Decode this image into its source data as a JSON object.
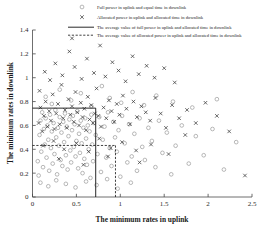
{
  "chart_data": {
    "type": "scatter",
    "title": "",
    "xlabel": "The minimum rates in uplink",
    "ylabel": "The minimum rates in downlink",
    "xlim": [
      0,
      2.5
    ],
    "ylim": [
      0,
      1.4
    ],
    "xticks": [
      "0",
      "0.5",
      "1",
      "1.5",
      "2",
      "2.5"
    ],
    "xtick_values": [
      0,
      0.5,
      1,
      1.5,
      2,
      2.5
    ],
    "yticks": [
      "0",
      "0.2",
      "0.4",
      "0.6",
      "0.8",
      "1",
      "1.2",
      "1.4"
    ],
    "ytick_values": [
      0,
      0.2,
      0.4,
      0.6,
      0.8,
      1,
      1.2,
      1.4
    ],
    "grid": false,
    "legend_position": "top",
    "legend": [
      {
        "marker": "circle-marker",
        "label": "Full power in uplink and equal time in downlink"
      },
      {
        "marker": "cross-marker",
        "label": "Allocated power in uplink and allocated time in downlink"
      },
      {
        "marker": "solid-line",
        "label": "The average value of full power in uplink and allocated time in downlink"
      },
      {
        "marker": "dashed-line",
        "label": "The average value of allocated power in uplink and allocated time in downlink"
      }
    ],
    "annotations": {
      "average_full_power_x": 0.72,
      "average_full_power_y": 0.745,
      "average_allocated_power_x": 0.945,
      "average_allocated_power_y": 0.432
    },
    "series": [
      {
        "name": "Full power in uplink and equal time in downlink",
        "marker": "circle-marker",
        "color": "#9a9a9a",
        "points": [
          [
            0.06,
            0.3
          ],
          [
            0.07,
            0.18
          ],
          [
            0.08,
            0.52
          ],
          [
            0.09,
            0.64
          ],
          [
            0.1,
            0.38
          ],
          [
            0.11,
            0.71
          ],
          [
            0.12,
            0.25
          ],
          [
            0.13,
            0.57
          ],
          [
            0.14,
            0.44
          ],
          [
            0.15,
            0.66
          ],
          [
            0.16,
            0.33
          ],
          [
            0.17,
            0.6
          ],
          [
            0.18,
            0.48
          ],
          [
            0.19,
            0.22
          ],
          [
            0.2,
            0.69
          ],
          [
            0.21,
            0.41
          ],
          [
            0.22,
            0.55
          ],
          [
            0.23,
            0.28
          ],
          [
            0.24,
            0.62
          ],
          [
            0.25,
            0.36
          ],
          [
            0.26,
            0.73
          ],
          [
            0.27,
            0.5
          ],
          [
            0.28,
            0.19
          ],
          [
            0.29,
            0.58
          ],
          [
            0.3,
            0.43
          ],
          [
            0.31,
            0.67
          ],
          [
            0.32,
            0.31
          ],
          [
            0.33,
            0.54
          ],
          [
            0.34,
            0.26
          ],
          [
            0.35,
            0.63
          ],
          [
            0.36,
            0.46
          ],
          [
            0.37,
            0.7
          ],
          [
            0.38,
            0.35
          ],
          [
            0.39,
            0.59
          ],
          [
            0.4,
            0.23
          ],
          [
            0.41,
            0.51
          ],
          [
            0.42,
            0.65
          ],
          [
            0.43,
            0.39
          ],
          [
            0.44,
            0.29
          ],
          [
            0.45,
            0.56
          ],
          [
            0.46,
            0.68
          ],
          [
            0.47,
            0.42
          ],
          [
            0.48,
            0.61
          ],
          [
            0.49,
            0.34
          ],
          [
            0.5,
            0.47
          ],
          [
            0.51,
            0.72
          ],
          [
            0.52,
            0.24
          ],
          [
            0.53,
            0.53
          ],
          [
            0.54,
            0.37
          ],
          [
            0.55,
            0.64
          ],
          [
            0.56,
            0.45
          ],
          [
            0.57,
            0.2
          ],
          [
            0.58,
            0.58
          ],
          [
            0.59,
            0.32
          ],
          [
            0.6,
            0.66
          ],
          [
            0.61,
            0.49
          ],
          [
            0.62,
            0.27
          ],
          [
            0.63,
            0.6
          ],
          [
            0.64,
            0.4
          ],
          [
            0.65,
            0.55
          ],
          [
            0.66,
            0.16
          ],
          [
            0.67,
            0.69
          ],
          [
            0.68,
            0.44
          ],
          [
            0.69,
            0.3
          ],
          [
            0.7,
            0.62
          ],
          [
            0.72,
            0.52
          ],
          [
            0.74,
            0.36
          ],
          [
            0.76,
            0.67
          ],
          [
            0.78,
            0.21
          ],
          [
            0.8,
            0.48
          ],
          [
            0.82,
            0.59
          ],
          [
            0.84,
            0.33
          ],
          [
            0.86,
            0.71
          ],
          [
            0.88,
            0.41
          ],
          [
            0.9,
            0.26
          ],
          [
            0.92,
            0.63
          ],
          [
            0.94,
            0.5
          ],
          [
            0.96,
            0.38
          ],
          [
            0.98,
            0.56
          ],
          [
            1.0,
            0.17
          ],
          [
            1.02,
            0.68
          ],
          [
            1.05,
            0.45
          ],
          [
            1.08,
            0.29
          ],
          [
            1.1,
            0.61
          ],
          [
            1.13,
            0.34
          ],
          [
            1.16,
            0.53
          ],
          [
            1.19,
            0.22
          ],
          [
            1.22,
            0.66
          ],
          [
            1.25,
            0.42
          ],
          [
            1.28,
            0.31
          ],
          [
            1.32,
            0.58
          ],
          [
            1.36,
            0.47
          ],
          [
            1.4,
            0.25
          ],
          [
            1.44,
            0.64
          ],
          [
            1.48,
            0.37
          ],
          [
            1.53,
            0.54
          ],
          [
            1.58,
            0.19
          ],
          [
            1.63,
            0.43
          ],
          [
            1.7,
            0.6
          ],
          [
            1.78,
            0.28
          ],
          [
            1.86,
            0.51
          ],
          [
            1.95,
            0.35
          ],
          [
            2.05,
            0.57
          ],
          [
            2.18,
            0.23
          ],
          [
            2.32,
            0.46
          ],
          [
            0.15,
            0.84
          ],
          [
            0.22,
            0.78
          ],
          [
            0.31,
            0.9
          ],
          [
            0.44,
            0.81
          ],
          [
            0.55,
            0.87
          ],
          [
            0.67,
            0.76
          ],
          [
            0.79,
            0.93
          ],
          [
            0.88,
            0.83
          ],
          [
            1.01,
            0.79
          ],
          [
            1.14,
            0.88
          ],
          [
            1.27,
            0.77
          ],
          [
            1.41,
            0.85
          ],
          [
            1.6,
            0.8
          ],
          [
            1.82,
            0.75
          ],
          [
            2.1,
            0.82
          ],
          [
            0.09,
            0.12
          ],
          [
            0.18,
            0.09
          ],
          [
            0.27,
            0.14
          ],
          [
            0.38,
            0.11
          ],
          [
            0.49,
            0.08
          ],
          [
            0.61,
            0.13
          ],
          [
            0.73,
            0.1
          ],
          [
            0.85,
            0.15
          ],
          [
            0.97,
            0.07
          ],
          [
            1.12,
            0.12
          ]
        ]
      },
      {
        "name": "Allocated power in uplink and allocated time in downlink",
        "marker": "cross-marker",
        "color": "#3a3a3a",
        "points": [
          [
            0.07,
            0.62
          ],
          [
            0.09,
            0.75
          ],
          [
            0.11,
            0.55
          ],
          [
            0.13,
            0.68
          ],
          [
            0.15,
            0.8
          ],
          [
            0.17,
            0.59
          ],
          [
            0.19,
            0.72
          ],
          [
            0.21,
            0.64
          ],
          [
            0.23,
            0.86
          ],
          [
            0.25,
            0.57
          ],
          [
            0.27,
            0.7
          ],
          [
            0.29,
            0.78
          ],
          [
            0.31,
            0.61
          ],
          [
            0.33,
            0.94
          ],
          [
            0.35,
            0.66
          ],
          [
            0.37,
            0.73
          ],
          [
            0.39,
            0.58
          ],
          [
            0.41,
            0.82
          ],
          [
            0.43,
            0.69
          ],
          [
            0.45,
            0.76
          ],
          [
            0.47,
            0.63
          ],
          [
            0.49,
            0.88
          ],
          [
            0.51,
            0.71
          ],
          [
            0.53,
            0.6
          ],
          [
            0.55,
            0.79
          ],
          [
            0.57,
            0.67
          ],
          [
            0.59,
            0.74
          ],
          [
            0.61,
            0.56
          ],
          [
            0.63,
            0.84
          ],
          [
            0.65,
            0.65
          ],
          [
            0.67,
            0.77
          ],
          [
            0.69,
            0.62
          ],
          [
            0.71,
            0.7
          ],
          [
            0.73,
            0.91
          ],
          [
            0.75,
            0.68
          ],
          [
            0.78,
            0.59
          ],
          [
            0.81,
            0.75
          ],
          [
            0.84,
            0.66
          ],
          [
            0.87,
            0.81
          ],
          [
            0.9,
            0.72
          ],
          [
            0.93,
            0.63
          ],
          [
            0.96,
            0.78
          ],
          [
            0.99,
            0.69
          ],
          [
            1.03,
            0.85
          ],
          [
            1.07,
            0.74
          ],
          [
            1.11,
            0.61
          ],
          [
            1.15,
            0.8
          ],
          [
            1.19,
            0.67
          ],
          [
            1.24,
            0.76
          ],
          [
            1.29,
            0.71
          ],
          [
            1.34,
            0.64
          ],
          [
            1.4,
            0.83
          ],
          [
            1.46,
            0.7
          ],
          [
            1.52,
            0.58
          ],
          [
            1.59,
            0.77
          ],
          [
            1.67,
            0.66
          ],
          [
            1.76,
            0.73
          ],
          [
            1.86,
            0.62
          ],
          [
            1.97,
            0.79
          ],
          [
            2.1,
            0.68
          ],
          [
            0.14,
            1.05
          ],
          [
            0.2,
            0.98
          ],
          [
            0.26,
            1.12
          ],
          [
            0.34,
            1.02
          ],
          [
            0.42,
            1.22
          ],
          [
            0.48,
            1.09
          ],
          [
            0.56,
            0.99
          ],
          [
            0.62,
            1.16
          ],
          [
            0.7,
            1.04
          ],
          [
            0.77,
            1.27
          ],
          [
            0.83,
            1.01
          ],
          [
            0.91,
            1.13
          ],
          [
            0.98,
            1.06
          ],
          [
            1.06,
            0.97
          ],
          [
            1.14,
            1.18
          ],
          [
            1.21,
            1.03
          ],
          [
            1.3,
            1.1
          ],
          [
            1.39,
            1.0
          ],
          [
            1.5,
            1.08
          ],
          [
            1.62,
            0.96
          ],
          [
            0.12,
            0.43
          ],
          [
            0.24,
            0.47
          ],
          [
            0.36,
            0.4
          ],
          [
            0.5,
            0.45
          ],
          [
            0.64,
            0.38
          ],
          [
            0.76,
            0.49
          ],
          [
            0.89,
            0.41
          ],
          [
            1.02,
            0.46
          ],
          [
            1.18,
            0.39
          ],
          [
            1.35,
            0.44
          ],
          [
            0.3,
            0.32
          ],
          [
            0.58,
            0.27
          ],
          [
            0.86,
            0.34
          ],
          [
            1.22,
            0.29
          ],
          [
            1.55,
            0.36
          ],
          [
            0.08,
            0.89
          ],
          [
            0.45,
            1.33
          ],
          [
            1.74,
            0.52
          ],
          [
            2.24,
            0.55
          ],
          [
            2.42,
            0.18
          ]
        ]
      }
    ]
  }
}
